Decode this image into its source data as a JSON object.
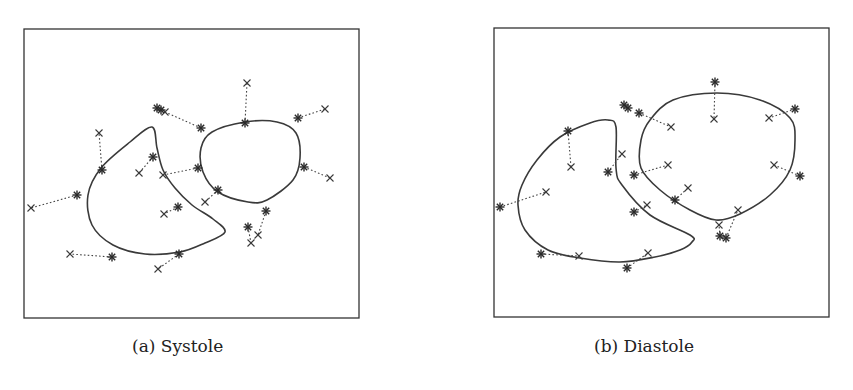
{
  "figure": {
    "panels": [
      {
        "id": "a",
        "caption": "(a) Systole",
        "frame": {
          "x": 24,
          "y": 29,
          "w": 335,
          "h": 289
        },
        "contours": [
          {
            "name": "crescent-contour",
            "points": [
              [
                152,
                127
              ],
              [
                130,
                142
              ],
              [
                101,
                168
              ],
              [
                88,
                195
              ],
              [
                92,
                225
              ],
              [
                113,
                245
              ],
              [
                145,
                254
              ],
              [
                180,
                252
              ],
              [
                205,
                243
              ],
              [
                225,
                232
              ],
              [
                213,
                219
              ],
              [
                192,
                205
              ],
              [
                175,
                188
              ],
              [
                163,
                170
              ],
              [
                157,
                148
              ],
              [
                152,
                127
              ]
            ]
          },
          {
            "name": "blob-contour",
            "points": [
              [
                245,
                122
              ],
              [
                277,
                122
              ],
              [
                296,
                133
              ],
              [
                300,
                158
              ],
              [
                293,
                180
              ],
              [
                267,
                200
              ],
              [
                248,
                202
              ],
              [
                218,
                192
              ],
              [
                203,
                172
              ],
              [
                201,
                148
              ],
              [
                212,
                132
              ],
              [
                245,
                122
              ]
            ]
          }
        ],
        "pairs": [
          {
            "star": [
              77,
              195
            ],
            "cross": [
              31,
              208
            ]
          },
          {
            "star": [
              102,
              170
            ],
            "cross": [
              99,
              133
            ]
          },
          {
            "star": [
              153,
              157
            ],
            "cross": [
              139,
              173
            ]
          },
          {
            "star": [
              201,
              128
            ],
            "cross": [
              165,
              112
            ]
          },
          {
            "star": [
              245,
              123
            ],
            "cross": [
              247,
              83
            ]
          },
          {
            "star": [
              298,
              118
            ],
            "cross": [
              325,
              109
            ]
          },
          {
            "star": [
              304,
              167
            ],
            "cross": [
              330,
              178
            ]
          },
          {
            "star": [
              198,
              168
            ],
            "cross": [
              163,
              175
            ]
          },
          {
            "star": [
              218,
              190
            ],
            "cross": [
              205,
              202
            ]
          },
          {
            "star": [
              178,
              207
            ],
            "cross": [
              164,
              214
            ]
          },
          {
            "star": [
              266,
              211
            ],
            "cross": [
              258,
              235
            ]
          },
          {
            "star": [
              248,
              227
            ],
            "cross": [
              251,
              243
            ]
          },
          {
            "star": [
              112,
              257
            ],
            "cross": [
              70,
              254
            ]
          },
          {
            "star": [
              179,
              254
            ],
            "cross": [
              158,
              269
            ]
          }
        ],
        "extra_stars": [
          [
            157,
            108
          ],
          [
            161,
            110
          ]
        ],
        "extra_crosses": []
      },
      {
        "id": "b",
        "caption": "(b) Diastole",
        "frame": {
          "x": 494,
          "y": 28,
          "w": 335,
          "h": 289
        },
        "contours": [
          {
            "name": "crescent-contour",
            "points": [
              [
                608,
                120
              ],
              [
                616,
                127
              ],
              [
                616,
                168
              ],
              [
                622,
                185
              ],
              [
                650,
                215
              ],
              [
                690,
                235
              ],
              [
                692,
                242
              ],
              [
                680,
                250
              ],
              [
                655,
                257
              ],
              [
                620,
                262
              ],
              [
                580,
                258
              ],
              [
                548,
                250
              ],
              [
                525,
                230
              ],
              [
                518,
                205
              ],
              [
                522,
                185
              ],
              [
                537,
                160
              ],
              [
                560,
                137
              ],
              [
                590,
                123
              ],
              [
                608,
                120
              ]
            ]
          },
          {
            "name": "circle-contour",
            "points": [
              [
                717,
                93
              ],
              [
                760,
                100
              ],
              [
                790,
                118
              ],
              [
                795,
                140
              ],
              [
                790,
                170
              ],
              [
                770,
                195
              ],
              [
                740,
                214
              ],
              [
                716,
                220
              ],
              [
                690,
                210
              ],
              [
                660,
                190
              ],
              [
                641,
                168
              ],
              [
                641,
                140
              ],
              [
                650,
                120
              ],
              [
                673,
                100
              ],
              [
                717,
                93
              ]
            ]
          }
        ],
        "pairs": [
          {
            "star": [
              500,
              207
            ],
            "cross": [
              546,
              192
            ]
          },
          {
            "star": [
              568,
              131
            ],
            "cross": [
              571,
              167
            ]
          },
          {
            "star": [
              608,
              172
            ],
            "cross": [
              622,
              154
            ]
          },
          {
            "star": [
              639,
              113
            ],
            "cross": [
              671,
              127
            ]
          },
          {
            "star": [
              715,
              82
            ],
            "cross": [
              714,
              119
            ]
          },
          {
            "star": [
              795,
              109
            ],
            "cross": [
              769,
              118
            ]
          },
          {
            "star": [
              800,
              176
            ],
            "cross": [
              774,
              165
            ]
          },
          {
            "star": [
              634,
              175
            ],
            "cross": [
              668,
              165
            ]
          },
          {
            "star": [
              675,
              200
            ],
            "cross": [
              688,
              188
            ]
          },
          {
            "star": [
              634,
              212
            ],
            "cross": [
              647,
              205
            ]
          },
          {
            "star": [
              720,
              236
            ],
            "cross": [
              719,
              225
            ]
          },
          {
            "star": [
              726,
              238
            ],
            "cross": [
              738,
              210
            ]
          },
          {
            "star": [
              541,
              254
            ],
            "cross": [
              579,
              256
            ]
          },
          {
            "star": [
              627,
              268
            ],
            "cross": [
              648,
              253
            ]
          }
        ],
        "extra_stars": [
          [
            624,
            105
          ],
          [
            628,
            108
          ]
        ],
        "extra_crosses": []
      }
    ],
    "legend_semantics": {
      "star": "asterisk marker",
      "cross": "x marker",
      "link": "dotted correspondence line"
    },
    "colors": {
      "ink": "#333333",
      "background": "#ffffff"
    }
  }
}
